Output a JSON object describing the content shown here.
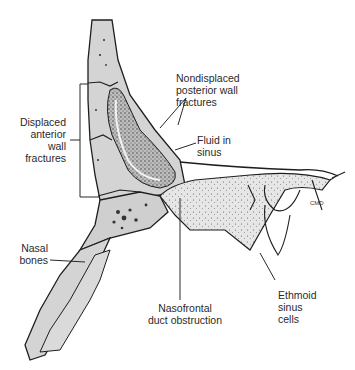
{
  "figure": {
    "colors": {
      "bone_fill": "#d4d4d4",
      "bone_outline": "#1e1e1e",
      "fluid_stipple": "#3a3a3a",
      "leader_line": "#2a2a2a",
      "background": "#ffffff"
    }
  },
  "labels": {
    "displaced_anterior": "Displaced\nanterior\nwall\nfractures",
    "nondisplaced_posterior": "Nondisplaced\nposterior wall\nfractures",
    "fluid_in_sinus": "Fluid in\nsinus",
    "nasal_bones": "Nasal\nbones",
    "nasofrontal_duct": "Nasofrontal\nduct obstruction",
    "ethmoid_cells": "Ethmoid\nsinus\ncells",
    "cmd_mark": "CMD"
  }
}
